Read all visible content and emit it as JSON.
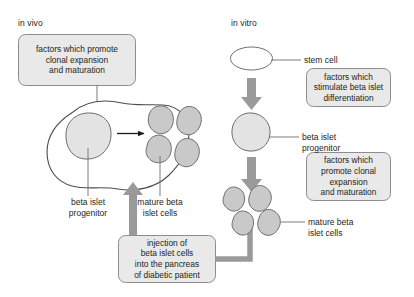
{
  "figure": {
    "panels": {
      "in_vivo_label": "in vivo",
      "in_vitro_label": "in vitro"
    },
    "boxes": {
      "in_vivo_factors": "factors which promote\nclonal expansion\nand maturation",
      "in_vitro_differentiation": "factors which\nstimulate beta islet\ndifferentiation",
      "in_vitro_expansion": "factors which\npromote clonal\nexpansion\nand maturation",
      "injection": "injection of\nbeta islet cells\ninto the pancreas\nof diabetic patient"
    },
    "labels": {
      "in_vivo_progenitor": "beta islet\nprogenitor",
      "in_vivo_mature": "mature beta\nislet cells",
      "stem_cell": "stem cell",
      "in_vitro_progenitor": "beta islet\nprogenitor",
      "in_vitro_mature": "mature beta\nislet cells"
    },
    "colors": {
      "background": "#ffffff",
      "box_fill": "#e9e9e9",
      "box_stroke": "#8d8d8d",
      "text": "#231f20",
      "organ_stroke": "#4d4d4d",
      "progenitor_fill": "#e3e3e3",
      "mature_fill": "#c9c9c9",
      "cell_stroke": "#6e6e6e",
      "gray_arrow": "#9a9a9a",
      "black_arrow": "#1a1a1a",
      "leader_line": "#6e6e6e"
    }
  }
}
